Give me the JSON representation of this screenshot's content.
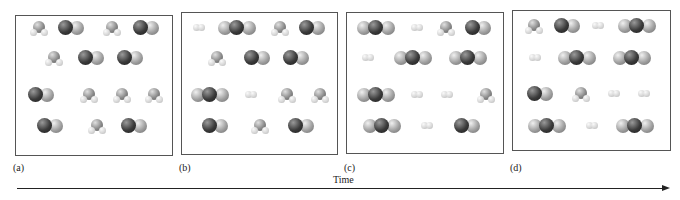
{
  "figure": {
    "panels": [
      {
        "label": "(a)",
        "x": 15,
        "y": 15,
        "w": 158,
        "h": 141,
        "molecules": [
          {
            "type": "H2O",
            "x": 30,
            "y": 28
          },
          {
            "type": "CO",
            "x": 58,
            "y": 28
          },
          {
            "type": "H2O",
            "x": 103,
            "y": 28
          },
          {
            "type": "CO",
            "x": 133,
            "y": 28
          },
          {
            "type": "H2O",
            "x": 45,
            "y": 58
          },
          {
            "type": "CO",
            "x": 78,
            "y": 58
          },
          {
            "type": "CO",
            "x": 117,
            "y": 58
          },
          {
            "type": "CO",
            "x": 28,
            "y": 95
          },
          {
            "type": "H2O",
            "x": 80,
            "y": 95
          },
          {
            "type": "H2O",
            "x": 113,
            "y": 95
          },
          {
            "type": "H2O",
            "x": 145,
            "y": 95
          },
          {
            "type": "CO",
            "x": 37,
            "y": 126
          },
          {
            "type": "H2O",
            "x": 88,
            "y": 126
          },
          {
            "type": "CO",
            "x": 121,
            "y": 126
          }
        ]
      },
      {
        "label": "(b)",
        "x": 181,
        "y": 12,
        "w": 157,
        "h": 143,
        "molecules": [
          {
            "type": "H2",
            "x": 193,
            "y": 28
          },
          {
            "type": "CO2",
            "x": 218,
            "y": 28
          },
          {
            "type": "H2O",
            "x": 271,
            "y": 28
          },
          {
            "type": "CO",
            "x": 299,
            "y": 28
          },
          {
            "type": "H2O",
            "x": 208,
            "y": 58
          },
          {
            "type": "CO",
            "x": 244,
            "y": 58
          },
          {
            "type": "CO",
            "x": 283,
            "y": 58
          },
          {
            "type": "CO2",
            "x": 191,
            "y": 95
          },
          {
            "type": "H2",
            "x": 245,
            "y": 95
          },
          {
            "type": "H2O",
            "x": 278,
            "y": 95
          },
          {
            "type": "H2O",
            "x": 311,
            "y": 95
          },
          {
            "type": "CO",
            "x": 202,
            "y": 126
          },
          {
            "type": "H2O",
            "x": 251,
            "y": 126
          },
          {
            "type": "CO",
            "x": 288,
            "y": 126
          }
        ]
      },
      {
        "label": "(c)",
        "x": 346,
        "y": 12,
        "w": 158,
        "h": 142,
        "molecules": [
          {
            "type": "CO2",
            "x": 357,
            "y": 28
          },
          {
            "type": "H2",
            "x": 411,
            "y": 28
          },
          {
            "type": "H2O",
            "x": 437,
            "y": 28
          },
          {
            "type": "CO",
            "x": 465,
            "y": 28
          },
          {
            "type": "H2",
            "x": 362,
            "y": 58
          },
          {
            "type": "CO2",
            "x": 394,
            "y": 58
          },
          {
            "type": "CO2",
            "x": 449,
            "y": 58
          },
          {
            "type": "CO2",
            "x": 357,
            "y": 95
          },
          {
            "type": "H2",
            "x": 411,
            "y": 95
          },
          {
            "type": "H2",
            "x": 441,
            "y": 95
          },
          {
            "type": "H2O",
            "x": 477,
            "y": 95
          },
          {
            "type": "CO2",
            "x": 363,
            "y": 126
          },
          {
            "type": "H2",
            "x": 421,
            "y": 126
          },
          {
            "type": "CO",
            "x": 454,
            "y": 126
          }
        ]
      },
      {
        "label": "(d)",
        "x": 512,
        "y": 10,
        "w": 159,
        "h": 141,
        "molecules": [
          {
            "type": "H2O",
            "x": 525,
            "y": 26
          },
          {
            "type": "CO",
            "x": 554,
            "y": 26
          },
          {
            "type": "H2",
            "x": 592,
            "y": 26
          },
          {
            "type": "CO2",
            "x": 618,
            "y": 26
          },
          {
            "type": "H2",
            "x": 529,
            "y": 58
          },
          {
            "type": "CO2",
            "x": 558,
            "y": 58
          },
          {
            "type": "CO2",
            "x": 613,
            "y": 58
          },
          {
            "type": "CO",
            "x": 527,
            "y": 94
          },
          {
            "type": "H2O",
            "x": 572,
            "y": 94
          },
          {
            "type": "H2",
            "x": 608,
            "y": 94
          },
          {
            "type": "H2",
            "x": 638,
            "y": 94
          },
          {
            "type": "CO2",
            "x": 528,
            "y": 126
          },
          {
            "type": "H2",
            "x": 586,
            "y": 126
          },
          {
            "type": "CO2",
            "x": 616,
            "y": 126
          }
        ]
      }
    ],
    "label_y": 162,
    "time_label": "Time"
  }
}
